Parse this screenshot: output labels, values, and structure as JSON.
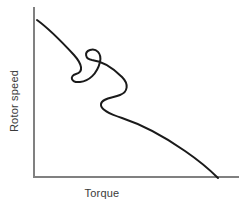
{
  "chart_data": {
    "type": "line",
    "title": "",
    "subtitle": "",
    "xlabel": "Torque",
    "ylabel": "Rotor speed",
    "xlim": [
      0,
      1
    ],
    "ylim": [
      0,
      1
    ],
    "grid": false,
    "legend": null,
    "axis_ticks": {
      "x": [],
      "y": []
    },
    "annotations": [],
    "series": [
      {
        "name": "torque-speed characteristic",
        "color": "#1a1a1a",
        "description": "Monotonically falling rotor speed versus torque with two S-shaped inflection dips in the upper-middle region, then a smooth concave fall to zero speed at maximum torque.",
        "points": [
          {
            "x": 0.02,
            "y": 0.94
          },
          {
            "x": 0.1,
            "y": 0.85
          },
          {
            "x": 0.17,
            "y": 0.76
          },
          {
            "x": 0.24,
            "y": 0.67
          },
          {
            "x": 0.29,
            "y": 0.61
          },
          {
            "x": 0.32,
            "y": 0.56
          },
          {
            "x": 0.27,
            "y": 0.52
          },
          {
            "x": 0.21,
            "y": 0.49
          },
          {
            "x": 0.23,
            "y": 0.44
          },
          {
            "x": 0.3,
            "y": 0.41
          },
          {
            "x": 0.38,
            "y": 0.38
          },
          {
            "x": 0.45,
            "y": 0.35
          },
          {
            "x": 0.45,
            "y": 0.3
          },
          {
            "x": 0.38,
            "y": 0.27
          },
          {
            "x": 0.3,
            "y": 0.28
          },
          {
            "x": 0.31,
            "y": 0.23
          },
          {
            "x": 0.38,
            "y": 0.2
          },
          {
            "x": 0.5,
            "y": 0.17
          },
          {
            "x": 0.63,
            "y": 0.14
          },
          {
            "x": 0.75,
            "y": 0.1
          },
          {
            "x": 0.85,
            "y": 0.06
          },
          {
            "x": 0.92,
            "y": 0.02
          },
          {
            "x": 0.95,
            "y": 0.0
          }
        ],
        "path_d": "M 37 20 C 48 28, 62 42, 74 55 C 82 64, 84 72, 76 74 C 69 76, 71 83, 80 82 C 89 81, 97 74, 100 62 C 102 53, 96 48, 90 50 C 84 52, 85 59, 92 60 C 101 61, 112 67, 122 77 C 129 84, 128 92, 120 95 C 113 98, 102 98, 101 104 C 100 110, 110 114, 122 118 C 140 124, 165 137, 185 151 C 201 162, 212 172, 218 178"
      }
    ],
    "axes": {
      "y_axis_path": "M 34 8 L 34 177",
      "x_axis_path": "M 34 177 L 238 177",
      "color": "#808080",
      "width": 2
    }
  },
  "labels": {
    "x_axis_title": "Torque",
    "y_axis_title": "Rotor speed"
  },
  "colors": {
    "background": "#ffffff",
    "axis": "#808080",
    "curve": "#1a1a1a",
    "text": "#3a3a3a"
  }
}
